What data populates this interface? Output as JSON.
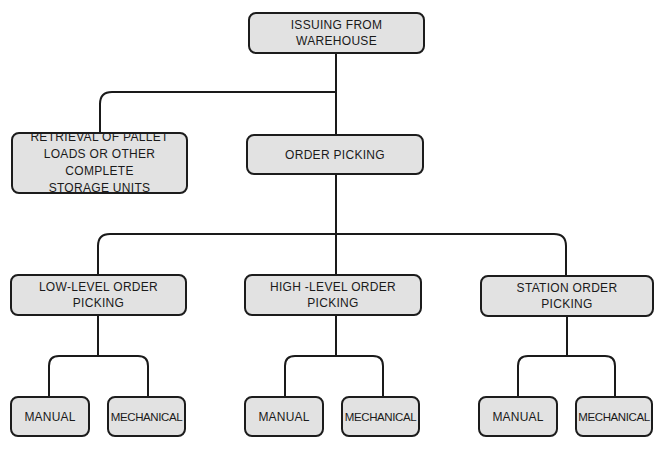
{
  "diagram": {
    "root": {
      "label": "ISSUING FROM WAREHOUSE"
    },
    "level1": [
      {
        "label": "RETRIEVAL OF PALLET\nLOADS OR OTHER COMPLETE\nSTORAGE UNITS"
      },
      {
        "label": "ORDER PICKING"
      }
    ],
    "level2": [
      {
        "label": "LOW-LEVEL ORDER\nPICKING"
      },
      {
        "label": "HIGH -LEVEL ORDER\nPICKING"
      },
      {
        "label": "STATION ORDER\nPICKING"
      }
    ],
    "leaves": [
      {
        "parent": "LOW-LEVEL ORDER PICKING",
        "manual": "MANUAL",
        "mechanical": "MECHANICAL"
      },
      {
        "parent": "HIGH -LEVEL ORDER PICKING",
        "manual": "MANUAL",
        "mechanical": "MECHANICAL"
      },
      {
        "parent": "STATION ORDER PICKING",
        "manual": "MANUAL",
        "mechanical": "MECHANICAL"
      }
    ],
    "colors": {
      "box_fill": "#e2e2e2",
      "stroke": "#1a1a1a",
      "background": "#ffffff"
    }
  }
}
